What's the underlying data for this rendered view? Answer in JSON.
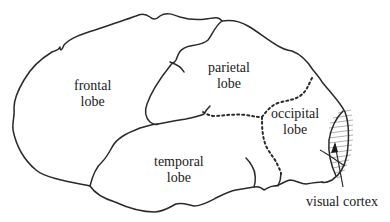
{
  "diagram": {
    "labels": {
      "frontal": [
        "frontal",
        "lobe"
      ],
      "parietal": [
        "parietal",
        "lobe"
      ],
      "occipital": [
        "occipital",
        "lobe"
      ],
      "temporal": [
        "temporal",
        "lobe"
      ],
      "visual_cortex": "visual cortex"
    },
    "colors": {
      "stroke": "#2a2a2a",
      "hatch": "#9a9a9a",
      "text": "#1a1a1a",
      "background": "#ffffff"
    }
  }
}
